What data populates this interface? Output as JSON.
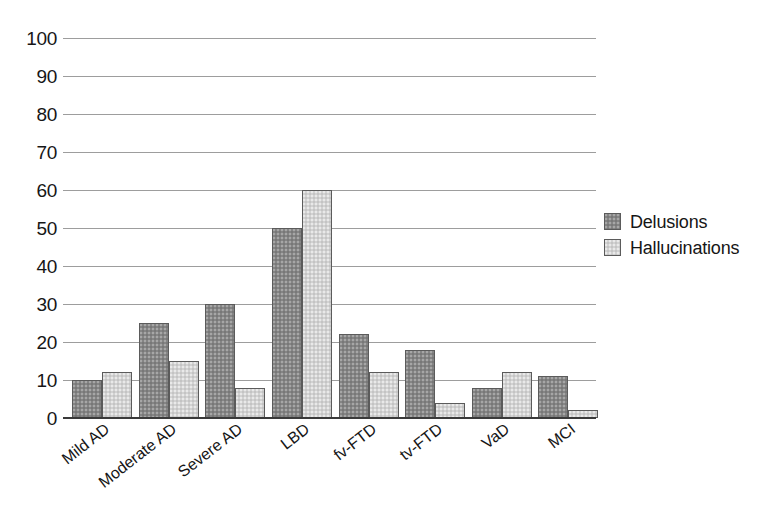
{
  "chart_data": {
    "type": "bar",
    "title": "",
    "subtitle": "",
    "xlabel": "",
    "ylabel": "",
    "ylim": [
      0,
      100
    ],
    "ytick_step": 10,
    "yticks": [
      "100",
      "90",
      "80",
      "70",
      "60",
      "50",
      "40",
      "30",
      "20",
      "10",
      "0"
    ],
    "grid": true,
    "legend_position": "right",
    "categories": [
      "Mild AD",
      "Moderate AD",
      "Severe AD",
      "LBD",
      "fv-FTD",
      "tv-FTD",
      "VaD",
      "MCI"
    ],
    "series": [
      {
        "name": "Delusions",
        "color": "#858585",
        "values": [
          10,
          25,
          30,
          50,
          22,
          18,
          8,
          11
        ]
      },
      {
        "name": "Hallucinations",
        "color": "#d2d2d2",
        "values": [
          12,
          15,
          8,
          60,
          12,
          4,
          12,
          2
        ]
      }
    ]
  },
  "legend": {
    "items": [
      {
        "label": "Delusions",
        "swatch": "dark-gray-swatch-icon"
      },
      {
        "label": "Hallucinations",
        "swatch": "light-gray-swatch-icon"
      }
    ]
  },
  "colors": {
    "series_delusions": "#858585",
    "series_hallucinations": "#d2d2d2",
    "gridline": "#9d9d9d",
    "axis": "#3a3a3a",
    "text": "#161616",
    "background": "#ffffff"
  }
}
